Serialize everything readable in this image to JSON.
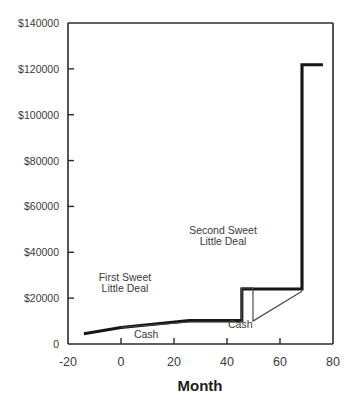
{
  "chart_data": {
    "type": "line",
    "title": "",
    "xlabel": "Month",
    "ylabel": "",
    "xlim": [
      -20,
      80
    ],
    "ylim": [
      0,
      140000
    ],
    "grid": false,
    "legend_position": "inline-annotations",
    "x_ticks": [
      -20,
      0,
      20,
      40,
      60,
      80
    ],
    "x_tick_labels": [
      "-20",
      "0",
      "20",
      "40",
      "60",
      "80"
    ],
    "y_ticks": [
      0,
      20000,
      40000,
      60000,
      80000,
      100000,
      120000,
      140000
    ],
    "y_tick_labels": [
      "0",
      "$20000",
      "$40000",
      "$60000",
      "$80000",
      "$100000",
      "$120000",
      "$140000"
    ],
    "annotations": [
      {
        "text_line1": "First Sweet",
        "text_line2": "Little Deal",
        "x": 1.5,
        "y": 27500
      },
      {
        "text_line1": "Second Sweet",
        "text_line2": "Little Deal",
        "x": 38.5,
        "y": 48000
      },
      {
        "text": "Cash",
        "x": 9.5,
        "y": 2500
      },
      {
        "text": "Cash",
        "x": 45.0,
        "y": 7000
      }
    ],
    "series": [
      {
        "name": "Equity",
        "style": "thick",
        "color": "#151515",
        "points": [
          [
            -14.0,
            4500
          ],
          [
            0.0,
            7200
          ],
          [
            25.8,
            10200
          ],
          [
            45.6,
            10200
          ],
          [
            45.6,
            24000
          ],
          [
            68.3,
            24000
          ],
          [
            68.3,
            121800
          ],
          [
            76.2,
            121800
          ]
        ]
      },
      {
        "name": "Cash",
        "style": "thin",
        "color": "#4a4a4a",
        "points": [
          [
            0.0,
            7200
          ],
          [
            25.8,
            9600
          ],
          [
            45.6,
            9600
          ],
          [
            45.6,
            24500
          ],
          [
            49.8,
            24500
          ],
          [
            49.8,
            10000
          ],
          [
            68.3,
            23000
          ]
        ]
      }
    ]
  }
}
